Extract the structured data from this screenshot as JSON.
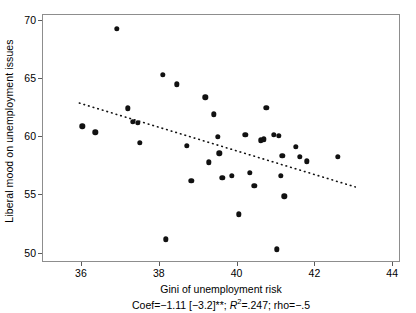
{
  "chart_data": {
    "type": "scatter",
    "title": "",
    "xlabel": "Gini of unemployment risk",
    "ylabel": "Liberal mood on unemployment issues",
    "xlim": [
      35.0,
      44.2
    ],
    "ylim": [
      49.2,
      70.5
    ],
    "xticks": [
      36,
      38,
      40,
      42,
      44
    ],
    "yticks": [
      50,
      55,
      60,
      65,
      70
    ],
    "grid": false,
    "legend": null,
    "marker_color": "#111111",
    "frame_color": "#8d8d8d",
    "points": [
      {
        "x": 36.04,
        "y": 60.85
      },
      {
        "x": 36.37,
        "y": 60.35
      },
      {
        "x": 36.93,
        "y": 69.25
      },
      {
        "x": 37.2,
        "y": 62.4
      },
      {
        "x": 37.34,
        "y": 61.25
      },
      {
        "x": 37.46,
        "y": 61.15
      },
      {
        "x": 37.52,
        "y": 59.45
      },
      {
        "x": 38.1,
        "y": 65.3
      },
      {
        "x": 38.18,
        "y": 51.15
      },
      {
        "x": 38.47,
        "y": 64.45
      },
      {
        "x": 38.72,
        "y": 59.2
      },
      {
        "x": 38.84,
        "y": 56.15
      },
      {
        "x": 39.2,
        "y": 63.35
      },
      {
        "x": 39.28,
        "y": 57.75
      },
      {
        "x": 39.42,
        "y": 61.9
      },
      {
        "x": 39.52,
        "y": 59.95
      },
      {
        "x": 39.56,
        "y": 58.55
      },
      {
        "x": 39.63,
        "y": 56.45
      },
      {
        "x": 39.88,
        "y": 56.6
      },
      {
        "x": 40.06,
        "y": 53.3
      },
      {
        "x": 40.22,
        "y": 60.15
      },
      {
        "x": 40.34,
        "y": 56.85
      },
      {
        "x": 40.46,
        "y": 55.75
      },
      {
        "x": 40.63,
        "y": 59.65
      },
      {
        "x": 40.7,
        "y": 59.75
      },
      {
        "x": 40.76,
        "y": 62.45
      },
      {
        "x": 40.95,
        "y": 60.1
      },
      {
        "x": 41.03,
        "y": 50.3
      },
      {
        "x": 41.09,
        "y": 60.05
      },
      {
        "x": 41.14,
        "y": 56.6
      },
      {
        "x": 41.18,
        "y": 58.3
      },
      {
        "x": 41.23,
        "y": 54.85
      },
      {
        "x": 41.52,
        "y": 59.1
      },
      {
        "x": 41.62,
        "y": 58.25
      },
      {
        "x": 41.8,
        "y": 57.85
      },
      {
        "x": 42.6,
        "y": 58.25
      }
    ],
    "trendline": {
      "x_start": 35.96,
      "y_start": 62.85,
      "x_end": 43.05,
      "y_end": 55.65,
      "style": "dotted",
      "color": "#111111"
    },
    "annotation": {
      "coef_prefix": "Coef",
      "coef_value": "−1.11",
      "coef_bracket": "[−3.2]",
      "coef_stars": "**",
      "r2_symbol": "R",
      "r2_exponent": "2",
      "r2_value": ".247",
      "rho_label": "rho",
      "rho_value": "−.5",
      "full_text": "Coef = −1.11 [−3.2]**; R² = .247; rho = −.5"
    }
  }
}
